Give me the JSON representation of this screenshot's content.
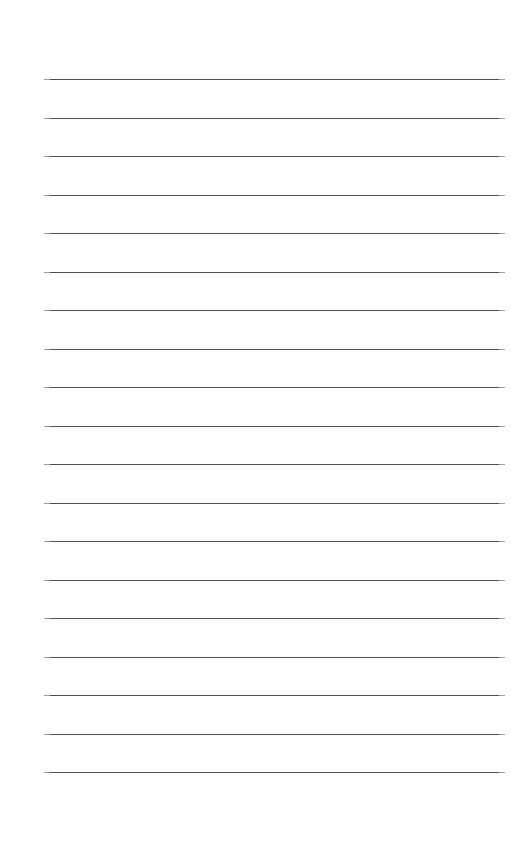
{
  "page": {
    "kind": "ruled-notepad-page",
    "width_px": 511,
    "height_px": 861,
    "background_color": "#ffffff",
    "orientation": "portrait",
    "content_text": ""
  },
  "rules": {
    "count": 19,
    "color": "#4f4f50",
    "thickness_px": 1,
    "left_x_px": 44,
    "right_x_px": 505,
    "line_length_px": 461,
    "first_line_y_px": 79,
    "last_line_y_px": 772,
    "spacing_px": 38.5,
    "y_positions": [
      79,
      117.5,
      156,
      194.5,
      233,
      271.5,
      310,
      348.5,
      387,
      425.5,
      464,
      502.5,
      541,
      579.5,
      618,
      656.5,
      695,
      733.5,
      772
    ],
    "line_labels": [
      "rule-line-1",
      "rule-line-2",
      "rule-line-3",
      "rule-line-4",
      "rule-line-5",
      "rule-line-6",
      "rule-line-7",
      "rule-line-8",
      "rule-line-9",
      "rule-line-10",
      "rule-line-11",
      "rule-line-12",
      "rule-line-13",
      "rule-line-14",
      "rule-line-15",
      "rule-line-16",
      "rule-line-17",
      "rule-line-18",
      "rule-line-19"
    ]
  },
  "margins": {
    "top_px": 79,
    "bottom_px": 89,
    "left_px": 44,
    "right_px": 6
  }
}
